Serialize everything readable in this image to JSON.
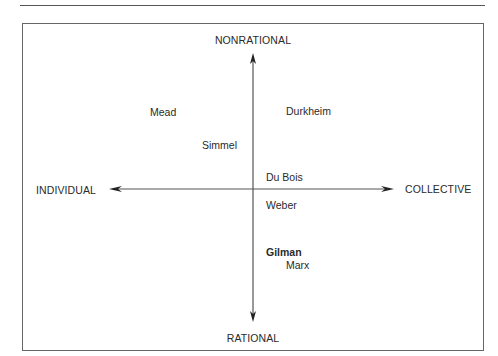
{
  "figure": {
    "header_fragment": "g"
  },
  "axes": {
    "top": "NONRATIONAL",
    "bottom": "RATIONAL",
    "left": "INDIVIDUAL",
    "right": "COLLECTIVE"
  },
  "theorists": [
    {
      "name": "Mead",
      "quadrant": "individual-nonrational",
      "emphasis": "normal"
    },
    {
      "name": "Durkheim",
      "quadrant": "collective-nonrational",
      "emphasis": "normal"
    },
    {
      "name": "Simmel",
      "quadrant": "individual-nonrational",
      "emphasis": "normal"
    },
    {
      "name": "Du Bois",
      "quadrant": "collective-nonrational",
      "emphasis": "normal"
    },
    {
      "name": "Weber",
      "quadrant": "collective-rational",
      "emphasis": "normal"
    },
    {
      "name": "Gilman",
      "quadrant": "collective-rational",
      "emphasis": "bold"
    },
    {
      "name": "Marx",
      "quadrant": "collective-rational",
      "emphasis": "normal"
    }
  ],
  "colors": {
    "axis_line": "#555555",
    "text": "#2a2a2a",
    "frame": "#666666"
  }
}
